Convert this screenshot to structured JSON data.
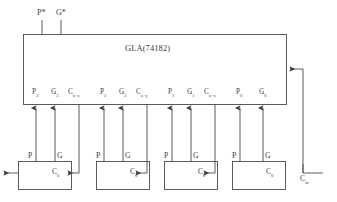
{
  "diagram": {
    "gla": {
      "label": "GLA(74182)",
      "outputs": [
        {
          "name": "p-star",
          "text": "P*"
        },
        {
          "name": "g-star",
          "text": "G*"
        }
      ],
      "ports": [
        {
          "name": "port-p3",
          "text": "P",
          "sub": "3"
        },
        {
          "name": "port-g3",
          "text": "G",
          "sub": "3"
        },
        {
          "name": "port-cnz",
          "text": "C",
          "sub": "n+z"
        },
        {
          "name": "port-p2",
          "text": "P",
          "sub": "2"
        },
        {
          "name": "port-g2",
          "text": "G",
          "sub": "2"
        },
        {
          "name": "port-cny",
          "text": "C",
          "sub": "n+y"
        },
        {
          "name": "port-p1",
          "text": "P",
          "sub": "1"
        },
        {
          "name": "port-g1",
          "text": "G",
          "sub": "1"
        },
        {
          "name": "port-cnx",
          "text": "C",
          "sub": "n+x"
        },
        {
          "name": "port-p0",
          "text": "P",
          "sub": "0"
        },
        {
          "name": "port-g0",
          "text": "G",
          "sub": "0"
        }
      ]
    },
    "adders": [
      {
        "name": "adder-3",
        "p_label": "P",
        "g_label": "G",
        "carry_label": "C",
        "carry_sub": "0"
      },
      {
        "name": "adder-2",
        "p_label": "P",
        "g_label": "G",
        "carry_label": "C",
        "carry_sub": "0"
      },
      {
        "name": "adder-1",
        "p_label": "P",
        "g_label": "G",
        "carry_label": "C",
        "carry_sub": "0"
      },
      {
        "name": "adder-0",
        "p_label": "P",
        "g_label": "G",
        "carry_label": "C",
        "carry_sub": "0"
      }
    ],
    "carry_in": {
      "text": "C",
      "sub": "in"
    },
    "colors": {
      "line": "#4a4a4a",
      "text": "#3a3a3a",
      "background": "#ffffff"
    }
  }
}
